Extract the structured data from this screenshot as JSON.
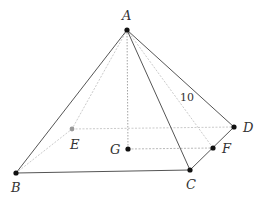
{
  "figure": {
    "colors": {
      "solid_edge": "#555555",
      "hidden_edge": "#bbbbbb",
      "height_line": "#999999",
      "vertex": "#111111",
      "hidden_vertex": "#999999",
      "label": "#333333"
    },
    "points": {
      "A": {
        "label": "A",
        "x": 127,
        "y": 30,
        "label_x": 122,
        "label_y": 20
      },
      "B": {
        "label": "B",
        "x": 16,
        "y": 173,
        "label_x": 11,
        "label_y": 192
      },
      "C": {
        "label": "C",
        "x": 190,
        "y": 170,
        "label_x": 186,
        "label_y": 189
      },
      "D": {
        "label": "D",
        "x": 234,
        "y": 127,
        "label_x": 243,
        "label_y": 132
      },
      "E": {
        "label": "E",
        "x": 72,
        "y": 129,
        "label_x": 70,
        "label_y": 149
      },
      "F": {
        "label": "F",
        "x": 213,
        "y": 148,
        "label_x": 222,
        "label_y": 153
      },
      "G": {
        "label": "G",
        "x": 128,
        "y": 149,
        "label_x": 110,
        "label_y": 154
      }
    },
    "measurements": [
      {
        "label": "10",
        "edge": "AD",
        "x": 180,
        "y": 101
      }
    ],
    "solid_edges": [
      "AB",
      "AC",
      "AD",
      "BC",
      "CD"
    ],
    "hidden_edges": [
      "AE",
      "AF",
      "BE",
      "ED",
      "GF"
    ],
    "height_segment": "AG"
  }
}
